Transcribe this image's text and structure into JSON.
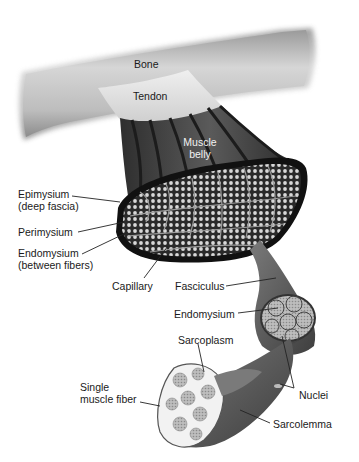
{
  "diagram": {
    "labels": {
      "bone": "Bone",
      "tendon": "Tendon",
      "muscle_belly_1": "Muscle",
      "muscle_belly_2": "belly",
      "epimysium_1": "Epimysium",
      "epimysium_2": "(deep fascia)",
      "perimysium": "Perimysium",
      "endomysium_between_1": "Endomysium",
      "endomysium_between_2": "(between fibers)",
      "capillary": "Capillary",
      "fasciculus": "Fasciculus",
      "endomysium": "Endomysium",
      "sarcoplasm": "Sarcoplasm",
      "single_fiber_1": "Single",
      "single_fiber_2": "muscle fiber",
      "nuclei": "Nuclei",
      "sarcolemma": "Sarcolemma"
    },
    "colors": {
      "bone": "#c8c8c8",
      "tendon": "#e6e6e6",
      "muscle": "#4a4a4a",
      "muscle_dark": "#1e1e1e",
      "fascicle_fill": "#d0d0d0",
      "label_text": "#1a1a1a"
    }
  }
}
